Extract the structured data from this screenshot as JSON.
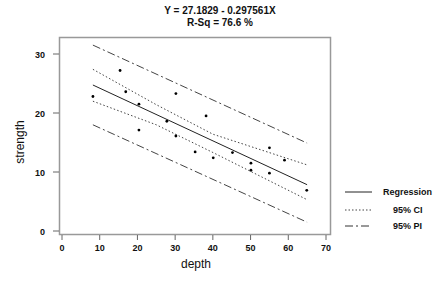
{
  "chart_data": {
    "type": "scatter",
    "title": "Y = 27.1829 - 0.297561X",
    "subtitle": "R-Sq = 76.6 %",
    "xlabel": "depth",
    "ylabel": "strength",
    "xlim": [
      0,
      70
    ],
    "ylim": [
      0,
      30
    ],
    "xticks": [
      0,
      10,
      20,
      30,
      40,
      50,
      60,
      70
    ],
    "yticks": [
      0,
      10,
      20,
      30
    ],
    "grid": false,
    "legend_position": "right",
    "legend": [
      "Regression",
      "95% CI",
      "95% PI"
    ],
    "regression": {
      "intercept": 27.1829,
      "slope": -0.297561,
      "r_sq_percent": 76.6,
      "x_range": [
        8.2,
        65
      ]
    },
    "points": [
      {
        "x": 8.2,
        "y": 22.8
      },
      {
        "x": 15.4,
        "y": 27.2
      },
      {
        "x": 16.9,
        "y": 23.6
      },
      {
        "x": 20.4,
        "y": 21.5
      },
      {
        "x": 20.4,
        "y": 17.1
      },
      {
        "x": 27.8,
        "y": 18.6
      },
      {
        "x": 30.2,
        "y": 23.3
      },
      {
        "x": 30.2,
        "y": 16.1
      },
      {
        "x": 35.3,
        "y": 13.4
      },
      {
        "x": 38.2,
        "y": 19.5
      },
      {
        "x": 40.1,
        "y": 12.4
      },
      {
        "x": 45.2,
        "y": 13.3
      },
      {
        "x": 50.1,
        "y": 11.5
      },
      {
        "x": 50.1,
        "y": 10.3
      },
      {
        "x": 55.0,
        "y": 14.1
      },
      {
        "x": 55.0,
        "y": 9.8
      },
      {
        "x": 59.0,
        "y": 12.0
      },
      {
        "x": 64.9,
        "y": 6.9
      }
    ],
    "series": [
      {
        "name": "Regression",
        "style": "solid",
        "x": [
          8.2,
          65
        ],
        "y": [
          24.74,
          7.84
        ]
      },
      {
        "name": "95% CI upper",
        "style": "dotted",
        "x": [
          8.2,
          25,
          40,
          65
        ],
        "y": [
          27.4,
          21.4,
          16.4,
          11.2
        ]
      },
      {
        "name": "95% CI lower",
        "style": "dotted",
        "x": [
          8.2,
          25,
          40,
          65
        ],
        "y": [
          22.0,
          18.0,
          13.3,
          5.3
        ]
      },
      {
        "name": "95% PI upper",
        "style": "dashdot",
        "x": [
          8.2,
          65
        ],
        "y": [
          31.5,
          14.9
        ]
      },
      {
        "name": "95% PI lower",
        "style": "dashdot",
        "x": [
          8.2,
          65
        ],
        "y": [
          18.0,
          1.5
        ]
      }
    ]
  }
}
